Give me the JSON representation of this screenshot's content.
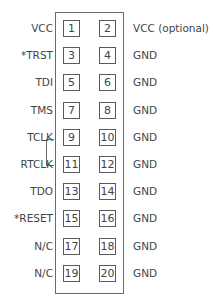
{
  "diagram": {
    "rows": [
      {
        "left_label": "VCC",
        "pin_odd": "1",
        "pin_even": "2",
        "right_label": "VCC (optional)"
      },
      {
        "left_label": "*TRST",
        "pin_odd": "3",
        "pin_even": "4",
        "right_label": "GND"
      },
      {
        "left_label": "TDI",
        "pin_odd": "5",
        "pin_even": "6",
        "right_label": "GND"
      },
      {
        "left_label": "TMS",
        "pin_odd": "7",
        "pin_even": "8",
        "right_label": "GND"
      },
      {
        "left_label": "TCLK",
        "pin_odd": "9",
        "pin_even": "10",
        "right_label": "GND"
      },
      {
        "left_label": "RTCLK",
        "pin_odd": "11",
        "pin_even": "12",
        "right_label": "GND"
      },
      {
        "left_label": "TDO",
        "pin_odd": "13",
        "pin_even": "14",
        "right_label": "GND"
      },
      {
        "left_label": "*RESET",
        "pin_odd": "15",
        "pin_even": "16",
        "right_label": "GND"
      },
      {
        "left_label": "N/C",
        "pin_odd": "17",
        "pin_even": "18",
        "right_label": "GND"
      },
      {
        "left_label": "N/C",
        "pin_odd": "19",
        "pin_even": "20",
        "right_label": "GND"
      }
    ],
    "bracket": {
      "connects": [
        "TCLK",
        "RTCLK"
      ]
    },
    "colors": {
      "line": "#6a6a6a",
      "text": "#444444",
      "background": "#ffffff"
    }
  }
}
